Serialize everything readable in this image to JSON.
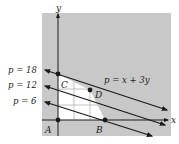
{
  "figure": {
    "axis_labels": {
      "x": "x",
      "y": "y"
    },
    "objective_label": "p = x + 3y",
    "level_lines": [
      {
        "label": "p = 18",
        "value": 18
      },
      {
        "label": "p = 12",
        "value": 12
      },
      {
        "label": "p = 6",
        "value": 6
      }
    ],
    "points": [
      {
        "name": "A",
        "label": "A"
      },
      {
        "name": "B",
        "label": "B"
      },
      {
        "name": "C",
        "label": "C"
      },
      {
        "name": "D",
        "label": "D"
      }
    ],
    "colors": {
      "background": "#c8c8c8",
      "feasible_region": "#ffffff",
      "lines": "#1a1a1a",
      "grid": "#9a9a9a"
    }
  }
}
